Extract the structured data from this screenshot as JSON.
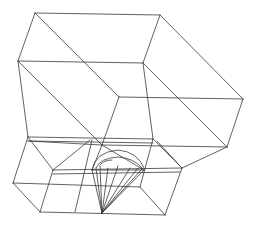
{
  "figure": {
    "title": "",
    "stroke_color": "#3a3a3a",
    "background": "#ffffff"
  },
  "wireframe": {
    "upper_box": [
      [
        35,
        13,
        160,
        15
      ],
      [
        35,
        13,
        18,
        61
      ],
      [
        160,
        15,
        143,
        63
      ],
      [
        18,
        61,
        143,
        63
      ],
      [
        35,
        13,
        119,
        97
      ],
      [
        160,
        15,
        243,
        99
      ],
      [
        143,
        63,
        227,
        147
      ],
      [
        18,
        61,
        102,
        145
      ],
      [
        119,
        97,
        243,
        99
      ],
      [
        243,
        99,
        227,
        147
      ],
      [
        119,
        97,
        102,
        145
      ],
      [
        18,
        61,
        28,
        137
      ],
      [
        143,
        63,
        153,
        139
      ],
      [
        119,
        97,
        102,
        145
      ]
    ],
    "lower_block": [
      [
        28,
        137,
        153,
        139
      ],
      [
        28,
        141,
        153,
        143
      ],
      [
        28,
        137,
        13,
        183
      ],
      [
        13,
        183,
        40,
        212
      ],
      [
        40,
        212,
        165,
        215
      ],
      [
        165,
        215,
        182,
        168
      ],
      [
        153,
        139,
        182,
        168
      ],
      [
        28,
        137,
        53,
        170
      ],
      [
        53,
        170,
        40,
        212
      ],
      [
        53,
        170,
        182,
        172
      ],
      [
        53,
        174,
        182,
        176
      ],
      [
        13,
        183,
        140,
        187
      ],
      [
        140,
        187,
        165,
        215
      ],
      [
        102,
        145,
        227,
        147
      ],
      [
        182,
        168,
        227,
        147
      ],
      [
        28,
        141,
        102,
        145
      ],
      [
        90,
        140,
        60,
        170
      ]
    ],
    "gem": {
      "apex": [
        102,
        213
      ],
      "rim": [
        [
          92,
          170
        ],
        [
          96,
          165
        ],
        [
          100,
          160
        ],
        [
          110,
          157
        ],
        [
          122,
          158
        ],
        [
          132,
          162
        ],
        [
          140,
          167
        ],
        [
          144,
          170
        ]
      ],
      "arcs": [
        "M 92 170 Q 95 152 118 150 Q 138 152 144 168",
        "M 96 168 Q 100 158 118 157 Q 134 158 142 168",
        "M 100 165 Q 104 160 112 160"
      ]
    }
  }
}
